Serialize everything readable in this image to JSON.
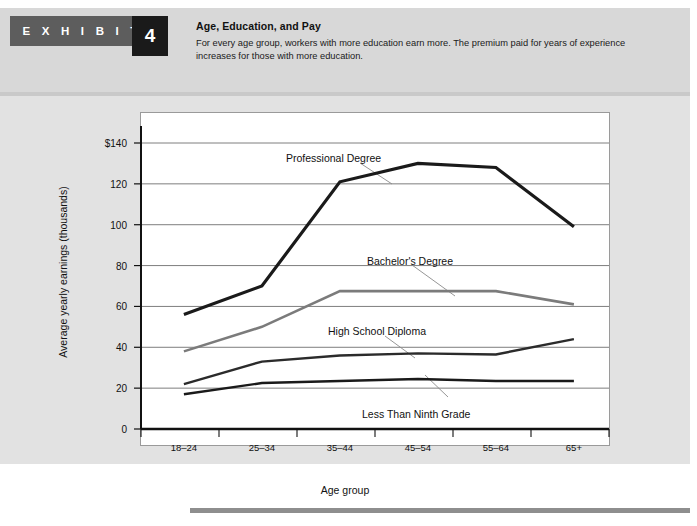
{
  "exhibit": {
    "tag_label": "E X H I B I T",
    "number": "4",
    "title": "Age, Education, and Pay",
    "description": "For every age group, workers with more education earn more. The premium paid for years of experience increases for those with more education."
  },
  "chart_data": {
    "type": "line",
    "title": "Age, Education, and Pay",
    "xlabel": "Age group",
    "ylabel": "Average yearly earnings (thousands)",
    "categories": [
      "18–24",
      "25–34",
      "35–44",
      "45–54",
      "55–64",
      "65+"
    ],
    "ylim": [
      0,
      140
    ],
    "yticks": [
      0,
      20,
      40,
      60,
      80,
      100,
      120,
      140
    ],
    "ytick_labels": [
      "0",
      "20",
      "40",
      "60",
      "80",
      "100",
      "120",
      "$140"
    ],
    "grid": true,
    "legend": "inline-annotations",
    "series": [
      {
        "name": "Professional Degree",
        "color": "#1a1a1a",
        "width": 3.2,
        "values": [
          56,
          70,
          121,
          130,
          128,
          99
        ]
      },
      {
        "name": "Bachelor's Degree",
        "color": "#7b7b7b",
        "width": 2.6,
        "values": [
          38,
          50,
          67.5,
          67.5,
          67.5,
          61
        ]
      },
      {
        "name": "High School Diploma",
        "color": "#2b2b2b",
        "width": 2.4,
        "values": [
          22,
          33,
          36,
          37,
          36.5,
          44
        ]
      },
      {
        "name": "Less Than Ninth Grade",
        "color": "#1a1a1a",
        "width": 2.4,
        "values": [
          17,
          22.5,
          23.5,
          24.5,
          23.5,
          23.5
        ]
      }
    ],
    "annotations": [
      {
        "text": "Professional Degree",
        "x": 286,
        "y": 152
      },
      {
        "text": "Bachelor's Degree",
        "x": 367,
        "y": 255
      },
      {
        "text": "High School Diploma",
        "x": 328,
        "y": 325
      },
      {
        "text": "Less Than Ninth Grade",
        "x": 362,
        "y": 408
      }
    ]
  }
}
